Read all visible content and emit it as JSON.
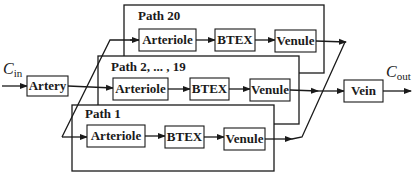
{
  "diagram": {
    "input_label": {
      "symbol": "C",
      "subscript": "in"
    },
    "output_label": {
      "symbol": "C",
      "subscript": "out"
    },
    "artery": {
      "label": "Artery"
    },
    "vein": {
      "label": "Vein"
    },
    "paths": [
      {
        "title": "Path 20",
        "nodes": [
          "Arteriole",
          "BTEX",
          "Venule"
        ]
      },
      {
        "title": "Path 2, ... , 19",
        "nodes": [
          "Arteriole",
          "BTEX",
          "Venule"
        ]
      },
      {
        "title": "Path 1",
        "nodes": [
          "Arteriole",
          "BTEX",
          "Venule"
        ]
      }
    ],
    "colors": {
      "stroke": "#1a1a1a",
      "background": "#ffffff"
    }
  }
}
